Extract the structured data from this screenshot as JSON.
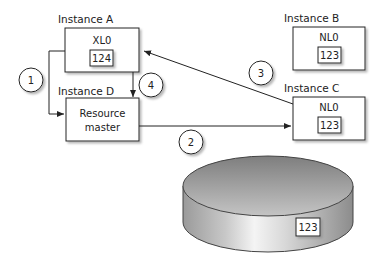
{
  "instances": {
    "a": {
      "label": "Instance A",
      "lock": "XL0",
      "value": "124"
    },
    "b": {
      "label": "Instance B",
      "lock": "NL0",
      "value": "123"
    },
    "c": {
      "label": "Instance C",
      "lock": "NL0",
      "value": "123"
    },
    "d": {
      "label": "Instance D",
      "line1": "Resource",
      "line2": "master"
    }
  },
  "steps": [
    "1",
    "2",
    "3",
    "4"
  ],
  "disk": {
    "value": "123"
  }
}
